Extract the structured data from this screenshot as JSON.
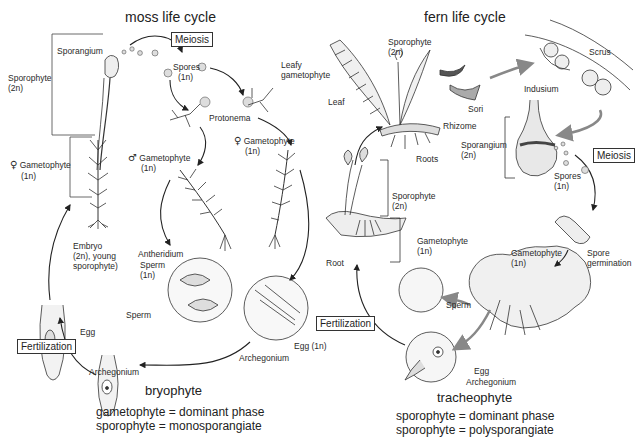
{
  "moss": {
    "title": "moss life cycle",
    "meiosis_box": "Meiosis",
    "fertilization_box": "Fertilization",
    "labels": {
      "sporangium": "Sporangium",
      "sporophyte": "Sporophyte",
      "sporophyte_ploidy": "(2n)",
      "female_gametophyte": "Gametophyte",
      "female_gametophyte_ploidy": "(1n)",
      "spores": "Spores",
      "spores_ploidy": "(1n)",
      "leafy_gametophyte_1": "Leafy",
      "leafy_gametophyte_2": "gametophyte",
      "protonema": "Protonema",
      "male_gametophyte": "Gametophyte",
      "male_gametophyte_ploidy": "(1n)",
      "female_gametophyte_2": "Gametophyte",
      "female_gametophyte_2_ploidy": "(1n)",
      "embryo_1": "Embryo",
      "embryo_2": "(2n), young",
      "embryo_3": "sporophyte)",
      "antheridium": "Antheridium",
      "sperm": "Sperm",
      "sperm_ploidy": "(1n)",
      "sperm_2": "Sperm",
      "egg": "Egg",
      "archegonium": "Archegonium",
      "archegonium_2": "Archegonium",
      "egg_1n": "Egg (1n)"
    },
    "group": "bryophyte",
    "summary_1": "gametophyte = dominant phase",
    "summary_2": "sporophyte = monosporangiate"
  },
  "fern": {
    "title": "fern life cycle",
    "meiosis_box": "Meiosis",
    "fertilization_box": "Fertilization",
    "labels": {
      "sporophyte": "Sporophyte",
      "sporophyte_ploidy": "(2n)",
      "leaf": "Leaf",
      "sori": "Sori",
      "rhizome": "Rhizome",
      "roots": "Roots",
      "scrus": "Scrus",
      "indusium": "Indusium",
      "sporangium": "Sporangium",
      "sporangium_ploidy": "(2n)",
      "spores": "Spores",
      "spores_ploidy": "(1n)",
      "young_sporophyte": "Sporophyte",
      "young_sporophyte_ploidy": "(2n)",
      "gametophyte": "Gametophyte",
      "gametophyte_ploidy": "(1n)",
      "root": "Root",
      "gametophyte_2": "Gametophyte",
      "gametophyte_2_ploidy": "(1n)",
      "spore_germination_1": "Spore",
      "spore_germination_2": "germination",
      "sperm": "Sperm",
      "egg": "Egg",
      "archegonium": "Archegonium"
    },
    "group": "tracheophyte",
    "summary_1": "sporophyte = dominant phase",
    "summary_2": "sporophyte = polysporangiate"
  },
  "symbols": {
    "female": "♀",
    "male": "♂"
  }
}
